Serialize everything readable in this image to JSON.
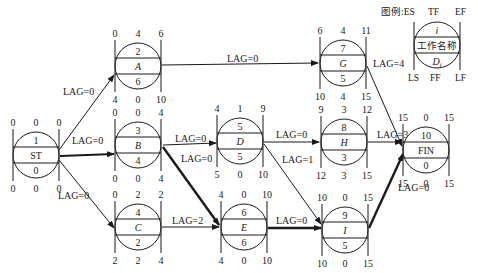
{
  "legend": {
    "title": "图例:ES",
    "top_labels": [
      "TF",
      "EF"
    ],
    "row_i": "i",
    "row_name": "工作名称",
    "row_d": "D",
    "row_d_sub": "i",
    "bottom_labels": [
      "LS",
      "FF",
      "LF"
    ]
  },
  "nodes": [
    {
      "id": "ST",
      "num": "1",
      "name": "ST",
      "italic": false,
      "dur": "0",
      "ES": "0",
      "TF": "0",
      "EF": "0",
      "LS": "0",
      "FF": "0",
      "LF": "0",
      "cx": 36,
      "cy": 155
    },
    {
      "id": "A",
      "num": "2",
      "name": "A",
      "italic": true,
      "dur": "6",
      "ES": "0",
      "TF": "4",
      "EF": "6",
      "LS": "4",
      "FF": "0",
      "LF": "10",
      "cx": 138,
      "cy": 66
    },
    {
      "id": "B",
      "num": "3",
      "name": "B",
      "italic": true,
      "dur": "4",
      "ES": "0",
      "TF": "0",
      "EF": "4",
      "LS": "0",
      "FF": "0",
      "LF": "4",
      "cx": 138,
      "cy": 145
    },
    {
      "id": "C",
      "num": "4",
      "name": "C",
      "italic": true,
      "dur": "2",
      "ES": "0",
      "TF": "2",
      "EF": "2",
      "LS": "2",
      "FF": "2",
      "LF": "4",
      "cx": 138,
      "cy": 227
    },
    {
      "id": "D",
      "num": "5",
      "name": "D",
      "italic": true,
      "dur": "5",
      "ES": "4",
      "TF": "1",
      "EF": "9",
      "LS": "5",
      "FF": "0",
      "LF": "10",
      "cx": 240,
      "cy": 141
    },
    {
      "id": "E",
      "num": "6",
      "name": "E",
      "italic": true,
      "dur": "6",
      "ES": "4",
      "TF": "0",
      "EF": "10",
      "LS": "4",
      "FF": "0",
      "LF": "10",
      "cx": 244,
      "cy": 227
    },
    {
      "id": "G",
      "num": "7",
      "name": "G",
      "italic": true,
      "dur": "5",
      "ES": "6",
      "TF": "4",
      "EF": "11",
      "LS": "10",
      "FF": "4",
      "LF": "15",
      "cx": 343,
      "cy": 63
    },
    {
      "id": "H",
      "num": "8",
      "name": "H",
      "italic": true,
      "dur": "3",
      "ES": "9",
      "TF": "3",
      "EF": "12",
      "LS": "12",
      "FF": "3",
      "LF": "15",
      "cx": 344,
      "cy": 142
    },
    {
      "id": "I",
      "num": "9",
      "name": "I",
      "italic": true,
      "dur": "5",
      "ES": "10",
      "TF": "0",
      "EF": "15",
      "LS": "10",
      "FF": "0",
      "LF": "15",
      "cx": 345,
      "cy": 230
    },
    {
      "id": "FIN",
      "num": "10",
      "name": "FIN",
      "italic": false,
      "dur": "0",
      "ES": "15",
      "TF": "0",
      "EF": "15",
      "LS": "15",
      "FF": "0",
      "LF": "15",
      "cx": 426,
      "cy": 150
    }
  ],
  "edges": [
    {
      "from": "ST",
      "to": "A",
      "label": "LAG=0",
      "critical": false
    },
    {
      "from": "ST",
      "to": "B",
      "label": "LAG=0",
      "critical": true
    },
    {
      "from": "ST",
      "to": "C",
      "label": "LAG=0",
      "critical": false
    },
    {
      "from": "A",
      "to": "G",
      "label": "LAG=0",
      "critical": false
    },
    {
      "from": "B",
      "to": "D",
      "label": "LAG=0",
      "critical": false
    },
    {
      "from": "B",
      "to": "E",
      "label": "LAG=0",
      "critical": true
    },
    {
      "from": "C",
      "to": "E",
      "label": "LAG=2",
      "critical": false
    },
    {
      "from": "D",
      "to": "H",
      "label": "LAG=0",
      "critical": false
    },
    {
      "from": "D",
      "to": "I",
      "label": "LAG=1",
      "critical": false
    },
    {
      "from": "E",
      "to": "I",
      "label": "LAG=0",
      "critical": true
    },
    {
      "from": "G",
      "to": "FIN",
      "label": "LAG=4",
      "critical": false
    },
    {
      "from": "H",
      "to": "FIN",
      "label": "LAG=3",
      "critical": false
    },
    {
      "from": "I",
      "to": "FIN",
      "label": "LAG=0",
      "critical": true
    }
  ]
}
